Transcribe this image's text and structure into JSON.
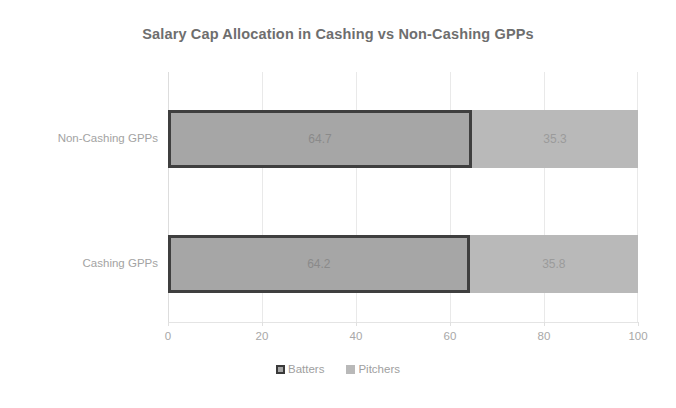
{
  "chart_data": {
    "type": "bar",
    "orientation": "horizontal",
    "stacked": true,
    "title": "Salary Cap Allocation in Cashing vs Non-Cashing GPPs",
    "xlabel": "",
    "ylabel": "",
    "xlim": [
      0,
      100
    ],
    "xticks": [
      0,
      20,
      40,
      60,
      80,
      100
    ],
    "xtick_labels": [
      "0",
      "20",
      "40",
      "60",
      "80",
      "100"
    ],
    "grid": "vertical",
    "legend_position": "bottom-center",
    "categories": [
      "Non-Cashing GPPs",
      "Cashing GPPs"
    ],
    "series": [
      {
        "name": "Batters",
        "values": [
          64.7,
          64.2
        ],
        "labels": [
          "64.7",
          "64.2"
        ],
        "fill": "#a6a6a6",
        "border": "#3f3f3f"
      },
      {
        "name": "Pitchers",
        "values": [
          35.3,
          35.8
        ],
        "labels": [
          "35.3",
          "35.8"
        ],
        "fill": "#b9b9b9",
        "border": "none"
      }
    ]
  },
  "legend": {
    "items": [
      {
        "label": "Batters"
      },
      {
        "label": "Pitchers"
      }
    ]
  },
  "colors": {
    "title": "#6e6e6e",
    "tick_text": "#a8a8a8",
    "category_text": "#a3a3a3",
    "gridline": "#e9e9e9",
    "background": "#ffffff"
  }
}
